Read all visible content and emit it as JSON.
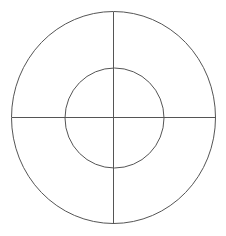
{
  "canvas": {
    "width": 226,
    "height": 236,
    "background_color": "#ffffff",
    "stroke_color": "#555555",
    "stroke_width": 1
  },
  "figure": {
    "center": {
      "x": 113.5,
      "y": 117.5
    },
    "shapes": [
      {
        "name": "outer-circle",
        "type": "ellipse",
        "cx": 113.5,
        "cy": 117.5,
        "rx": 102,
        "ry": 106,
        "fill": "none",
        "stroke": "#555555"
      },
      {
        "name": "inner-circle",
        "type": "ellipse",
        "cx": 114.5,
        "cy": 118,
        "rx": 49.5,
        "ry": 50,
        "fill": "none",
        "stroke": "#555555"
      }
    ],
    "axes": [
      {
        "name": "horizontal-axis-line",
        "type": "line",
        "x1": 11.5,
        "y1": 117.5,
        "x2": 215.5,
        "y2": 117.5,
        "stroke": "#555555"
      },
      {
        "name": "vertical-axis-line",
        "type": "line",
        "x1": 113.5,
        "y1": 11.5,
        "x2": 113.5,
        "y2": 223.5,
        "stroke": "#555555"
      }
    ]
  }
}
